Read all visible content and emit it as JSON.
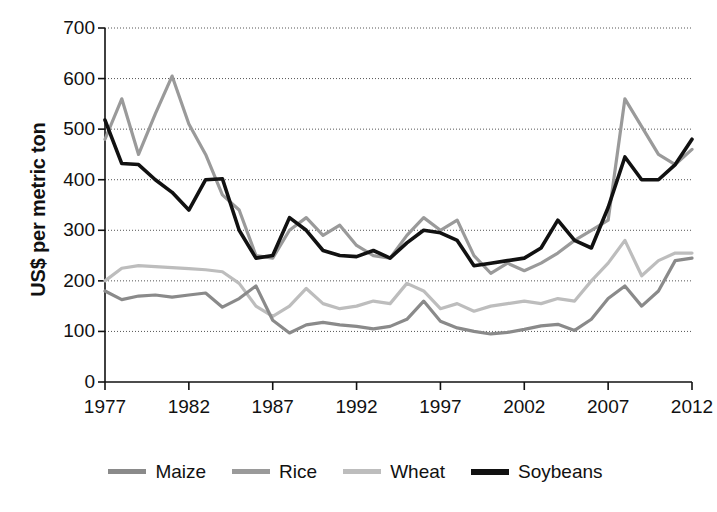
{
  "chart_data": {
    "type": "line",
    "title": "",
    "subtitle": "",
    "xlabel": "",
    "ylabel": "US$ per metric ton",
    "xlim": [
      1977,
      2012
    ],
    "ylim": [
      0,
      700
    ],
    "grid": true,
    "legend_position": "bottom",
    "x": [
      1977,
      1978,
      1979,
      1980,
      1981,
      1982,
      1983,
      1984,
      1985,
      1986,
      1987,
      1988,
      1989,
      1990,
      1991,
      1992,
      1993,
      1994,
      1995,
      1996,
      1997,
      1998,
      1999,
      2000,
      2001,
      2002,
      2003,
      2004,
      2005,
      2006,
      2007,
      2008,
      2009,
      2010,
      2011,
      2012
    ],
    "y_ticks": [
      0,
      100,
      200,
      300,
      400,
      500,
      600,
      700
    ],
    "x_ticks": [
      1977,
      1982,
      1987,
      1992,
      1997,
      2002,
      2007,
      2012
    ],
    "series": [
      {
        "name": "Maize",
        "color": "#8a8a8a",
        "values": [
          180,
          163,
          170,
          172,
          168,
          172,
          176,
          148,
          165,
          190,
          122,
          97,
          113,
          118,
          113,
          110,
          105,
          110,
          124,
          160,
          120,
          107,
          100,
          95,
          98,
          104,
          111,
          114,
          102,
          124,
          165,
          190,
          150,
          180,
          240,
          245
        ]
      },
      {
        "name": "Rice",
        "color": "#9a9a9a",
        "values": [
          480,
          560,
          450,
          530,
          605,
          510,
          450,
          370,
          340,
          250,
          245,
          300,
          325,
          290,
          310,
          270,
          250,
          245,
          290,
          325,
          300,
          320,
          250,
          215,
          235,
          220,
          235,
          255,
          280,
          300,
          320,
          560,
          505,
          450,
          430,
          460
        ]
      },
      {
        "name": "Wheat",
        "color": "#bdbdbd",
        "values": [
          200,
          225,
          230,
          228,
          226,
          224,
          222,
          218,
          195,
          150,
          130,
          150,
          185,
          155,
          145,
          150,
          160,
          155,
          195,
          180,
          145,
          155,
          140,
          150,
          155,
          160,
          155,
          165,
          160,
          200,
          235,
          280,
          210,
          240,
          255,
          255
        ]
      },
      {
        "name": "Soybeans",
        "color": "#111111",
        "values": [
          518,
          432,
          430,
          400,
          375,
          340,
          400,
          402,
          300,
          245,
          250,
          325,
          300,
          260,
          250,
          248,
          260,
          245,
          275,
          300,
          295,
          280,
          230,
          235,
          240,
          245,
          265,
          320,
          280,
          265,
          345,
          445,
          400,
          400,
          430,
          480
        ]
      }
    ]
  },
  "legend": {
    "items": [
      {
        "label": "Maize"
      },
      {
        "label": "Rice"
      },
      {
        "label": "Wheat"
      },
      {
        "label": "Soybeans"
      }
    ]
  }
}
